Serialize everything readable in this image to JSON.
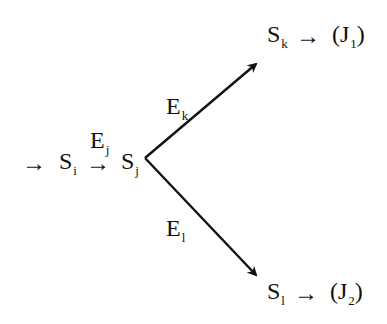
{
  "diagram": {
    "colors": {
      "ink": "#111111",
      "background": "#ffffff"
    },
    "nodes": {
      "entry_arrow": "→",
      "si": {
        "base": "S",
        "sub": "i"
      },
      "si_arrow": "→",
      "sj": {
        "base": "S",
        "sub": "j"
      },
      "sk": {
        "base": "S",
        "sub": "k"
      },
      "sk_arrow": "→",
      "j1": {
        "open": "(J",
        "sub": "1",
        "close": ")"
      },
      "sl": {
        "base": "S",
        "sub": "l"
      },
      "sl_arrow": "→",
      "j2": {
        "open": "(J",
        "sub": "2",
        "close": ")"
      }
    },
    "edges": {
      "ej": {
        "base": "E",
        "sub": "j"
      },
      "ek": {
        "base": "E",
        "sub": "k"
      },
      "el": {
        "base": "E",
        "sub": "l"
      }
    }
  }
}
